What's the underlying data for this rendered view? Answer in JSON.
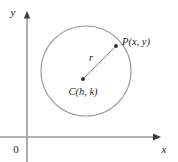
{
  "figure": {
    "name": "circle-standard-form-diagram",
    "background_color": "#ffffff",
    "width": 178,
    "height": 162
  },
  "axes": {
    "x_axis": {
      "label": "x",
      "label_x": 163,
      "label_y": 152,
      "line_y": 137,
      "line_x_start": 0,
      "line_x_end": 158,
      "color": "#9b9b9b"
    },
    "y_axis": {
      "label": "y",
      "label_x": 13,
      "label_y": 16,
      "line_x": 27,
      "line_y_start": 15,
      "line_y_end": 162,
      "color": "#9b9b9b"
    },
    "origin": {
      "label": "0",
      "label_x": 14,
      "label_y": 152
    },
    "arrow_color": "#3b3b3b"
  },
  "circle": {
    "center_x": 86,
    "center_y": 71,
    "radius": 45,
    "stroke_color": "#9a9a9a",
    "stroke_width": 1.1,
    "fill": "none"
  },
  "points": {
    "center": {
      "name": "C",
      "label": "C(h, k)",
      "dot_x": 83,
      "dot_y": 79,
      "dot_r": 1.9,
      "label_x": 83,
      "label_y": 95,
      "label_anchor": "middle"
    },
    "on_circle": {
      "name": "P",
      "label": "P(x, y)",
      "dot_x": 116,
      "dot_y": 46,
      "dot_r": 1.9,
      "label_x": 122,
      "label_y": 45,
      "label_anchor": "start"
    }
  },
  "radius_segment": {
    "label": "r",
    "label_x": 91,
    "label_y": 61,
    "from_x": 83,
    "from_y": 79,
    "to_x": 116,
    "to_y": 46,
    "stroke_color": "#8d8d8d"
  },
  "colors": {
    "ink": "#231f20",
    "axis_gray": "#9b9b9b",
    "curve_gray": "#9a9a9a",
    "dot_dark": "#2b2b2b",
    "background": "#ffffff"
  }
}
